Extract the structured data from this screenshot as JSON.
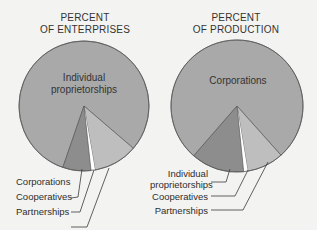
{
  "chart_data": [
    {
      "type": "pie",
      "title": "PERCENT OF ENTERPRISES",
      "title_lines": [
        "PERCENT",
        "OF ENTERPRISES"
      ],
      "categories": [
        "Individual proprietorships",
        "Partnerships",
        "Cooperatives",
        "Corporations"
      ],
      "values": [
        81,
        11,
        1,
        7
      ],
      "colors": [
        "#a9a9a9",
        "#bebebe",
        "#ffffff",
        "#8d8d8d"
      ],
      "inner_label": [
        "Individual",
        "proprietorships"
      ],
      "external_labels": [
        "Corporations",
        "Cooperatives",
        "Partnerships"
      ],
      "legend": "none (labels with leader lines)"
    },
    {
      "type": "pie",
      "title": "PERCENT OF PRODUCTION",
      "title_lines": [
        "PERCENT",
        "OF PRODUCTION"
      ],
      "categories": [
        "Corporations",
        "Partnerships",
        "Cooperatives",
        "Individual proprietorships"
      ],
      "values": [
        77,
        9,
        1,
        13
      ],
      "colors": [
        "#a9a9a9",
        "#bebebe",
        "#ffffff",
        "#8d8d8d"
      ],
      "inner_label": [
        "Corporations"
      ],
      "external_labels": [
        "Individual proprietorships",
        "Cooperatives",
        "Partnerships"
      ],
      "legend": "none (labels with leader lines)"
    }
  ],
  "left": {
    "title_line1": "PERCENT",
    "title_line2": "OF ENTERPRISES",
    "inner_label_line1": "Individual",
    "inner_label_line2": "proprietorships",
    "labels": {
      "corporations": "Corporations",
      "cooperatives": "Cooperatives",
      "partnerships": "Partnerships"
    }
  },
  "right": {
    "title_line1": "PERCENT",
    "title_line2": "OF PRODUCTION",
    "inner_label": "Corporations",
    "labels": {
      "individual_line1": "Individual",
      "individual_line2": "proprietorships",
      "cooperatives": "Cooperatives",
      "partnerships": "Partnerships"
    }
  },
  "colors": {
    "background": "#f3f3f1",
    "main_slice": "#a9a9a9",
    "dark_slice": "#8d8d8d",
    "light_slice": "#bebebe",
    "gap_slice": "#ffffff",
    "outline": "#5a5a5a",
    "leader": "#3a3a3a"
  }
}
